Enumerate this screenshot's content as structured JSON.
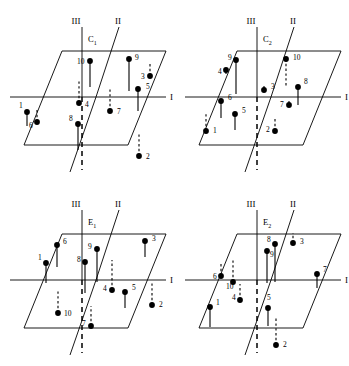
{
  "figure": {
    "title": "",
    "background_color": "#ffffff",
    "ink_color": "#000000",
    "width": 349,
    "height": 366,
    "panel_grid": {
      "rows": 2,
      "cols": 2
    }
  },
  "axis_labels": {
    "axis_i": "I",
    "axis_ii": "II",
    "axis_iii": "III"
  },
  "panels": [
    {
      "id": "panel-c1",
      "label": "C",
      "label_sub": "1",
      "position": {
        "x": 0,
        "y": 0
      },
      "sites": [
        {
          "num": "1",
          "dot": [
            27,
            112
          ],
          "label_pos": [
            19,
            108
          ],
          "stem": "down",
          "style": "solid",
          "stem_len": 14
        },
        {
          "num": "2",
          "dot": [
            139,
            156
          ],
          "label_pos": [
            146,
            159
          ],
          "stem": "up",
          "style": "dashed",
          "stem_len": 22
        },
        {
          "num": "3",
          "dot": [
            150,
            76
          ],
          "label_pos": [
            141,
            79
          ],
          "stem": "up",
          "style": "dashed",
          "stem_len": 13
        },
        {
          "num": "4",
          "dot": [
            79,
            103
          ],
          "label_pos": [
            85,
            107
          ],
          "stem": "up",
          "style": "dashed",
          "stem_len": 24
        },
        {
          "num": "5",
          "dot": [
            138,
            89
          ],
          "label_pos": [
            146,
            89
          ],
          "stem": "down",
          "style": "solid",
          "stem_len": 22
        },
        {
          "num": "6",
          "dot": [
            37,
            122
          ],
          "label_pos": [
            29,
            128
          ],
          "stem": "up",
          "style": "dashed",
          "stem_len": 14
        },
        {
          "num": "7",
          "dot": [
            110,
            111
          ],
          "label_pos": [
            117,
            114
          ],
          "stem": "up",
          "style": "dashed",
          "stem_len": 22
        },
        {
          "num": "8",
          "dot": [
            78,
            124
          ],
          "label_pos": [
            69,
            121
          ],
          "stem": "down",
          "style": "solid",
          "stem_len": 26
        },
        {
          "num": "9",
          "dot": [
            129,
            59
          ],
          "label_pos": [
            135,
            60
          ],
          "stem": "down",
          "style": "solid",
          "stem_len": 32
        },
        {
          "num": "10",
          "dot": [
            90,
            61
          ],
          "label_pos": [
            77,
            64
          ],
          "stem": "down",
          "style": "solid",
          "stem_len": 26
        }
      ]
    },
    {
      "id": "panel-c2",
      "label": "C",
      "label_sub": "2",
      "position": {
        "x": 175,
        "y": 0
      },
      "sites": [
        {
          "num": "1",
          "dot": [
            31,
            131
          ],
          "label_pos": [
            38,
            133
          ],
          "stem": "up",
          "style": "dashed",
          "stem_len": 18
        },
        {
          "num": "2",
          "dot": [
            100,
            131
          ],
          "label_pos": [
            91,
            132
          ],
          "stem": "up",
          "style": "dashed",
          "stem_len": 14
        },
        {
          "num": "3",
          "dot": [
            89,
            90
          ],
          "label_pos": [
            96,
            89
          ],
          "stem": "up",
          "style": "solid",
          "stem_len": 4
        },
        {
          "num": "4",
          "dot": [
            51,
            70
          ],
          "label_pos": [
            43,
            74
          ],
          "stem": "down",
          "style": "solid",
          "stem_len": 4
        },
        {
          "num": "5",
          "dot": [
            60,
            114
          ],
          "label_pos": [
            67,
            113
          ],
          "stem": "down",
          "style": "solid",
          "stem_len": 16
        },
        {
          "num": "6",
          "dot": [
            46,
            101
          ],
          "label_pos": [
            53,
            100
          ],
          "stem": "down",
          "style": "solid",
          "stem_len": 17
        },
        {
          "num": "7",
          "dot": [
            114,
            105
          ],
          "label_pos": [
            105,
            107
          ],
          "stem": "up",
          "style": "solid",
          "stem_len": 4
        },
        {
          "num": "8",
          "dot": [
            123,
            87
          ],
          "label_pos": [
            129,
            84
          ],
          "stem": "down",
          "style": "solid",
          "stem_len": 18
        },
        {
          "num": "9",
          "dot": [
            61,
            60
          ],
          "label_pos": [
            53,
            60
          ],
          "stem": "down",
          "style": "solid",
          "stem_len": 34
        },
        {
          "num": "10",
          "dot": [
            111,
            59
          ],
          "label_pos": [
            118,
            60
          ],
          "stem": "down",
          "style": "dashed",
          "stem_len": 28
        }
      ]
    },
    {
      "id": "panel-e1",
      "label": "E",
      "label_sub": "1",
      "position": {
        "x": 0,
        "y": 183
      },
      "sites": [
        {
          "num": "1",
          "dot": [
            46,
            80
          ],
          "label_pos": [
            38,
            77
          ],
          "stem": "down",
          "style": "solid",
          "stem_len": 20
        },
        {
          "num": "2",
          "dot": [
            152,
            122
          ],
          "label_pos": [
            159,
            124
          ],
          "stem": "up",
          "style": "dashed",
          "stem_len": 24
        },
        {
          "num": "3",
          "dot": [
            145,
            58
          ],
          "label_pos": [
            152,
            58
          ],
          "stem": "down",
          "style": "solid",
          "stem_len": 16
        },
        {
          "num": "4",
          "dot": [
            112,
            107
          ],
          "label_pos": [
            103,
            108
          ],
          "stem": "up",
          "style": "dashed",
          "stem_len": 30
        },
        {
          "num": "5",
          "dot": [
            125,
            109
          ],
          "label_pos": [
            132,
            107
          ],
          "stem": "down",
          "style": "solid",
          "stem_len": 16
        },
        {
          "num": "6",
          "dot": [
            57,
            62
          ],
          "label_pos": [
            63,
            61
          ],
          "stem": "down",
          "style": "solid",
          "stem_len": 22
        },
        {
          "num": "7",
          "dot": [
            91,
            143
          ],
          "label_pos": [
            82,
            143
          ],
          "stem": "up",
          "style": "dashed",
          "stem_len": 20
        },
        {
          "num": "8",
          "dot": [
            85,
            79
          ],
          "label_pos": [
            77,
            79
          ],
          "stem": "down",
          "style": "solid",
          "stem_len": 31
        },
        {
          "num": "9",
          "dot": [
            97,
            66
          ],
          "label_pos": [
            88,
            66
          ],
          "stem": "down",
          "style": "solid",
          "stem_len": 33
        },
        {
          "num": "10",
          "dot": [
            58,
            130
          ],
          "label_pos": [
            64,
            133
          ],
          "stem": "up",
          "style": "dashed",
          "stem_len": 22
        }
      ]
    },
    {
      "id": "panel-e2",
      "label": "E",
      "label_sub": "2",
      "position": {
        "x": 175,
        "y": 183
      },
      "sites": [
        {
          "num": "1",
          "dot": [
            35,
            124
          ],
          "label_pos": [
            41,
            122
          ],
          "stem": "down",
          "style": "solid",
          "stem_len": 20
        },
        {
          "num": "2",
          "dot": [
            101,
            162
          ],
          "label_pos": [
            108,
            164
          ],
          "stem": "up",
          "style": "dashed",
          "stem_len": 28
        },
        {
          "num": "3",
          "dot": [
            118,
            60
          ],
          "label_pos": [
            125,
            61
          ],
          "stem": "up",
          "style": "dashed",
          "stem_len": 10
        },
        {
          "num": "4",
          "dot": [
            65,
            117
          ],
          "label_pos": [
            57,
            117
          ],
          "stem": "up",
          "style": "dashed",
          "stem_len": 16
        },
        {
          "num": "5",
          "dot": [
            93,
            125
          ],
          "label_pos": [
            92,
            117
          ],
          "stem": "down",
          "style": "solid",
          "stem_len": 18
        },
        {
          "num": "6",
          "dot": [
            46,
            93
          ],
          "label_pos": [
            38,
            96
          ],
          "stem": "up",
          "style": "dashed",
          "stem_len": 13
        },
        {
          "num": "7",
          "dot": [
            142,
            91
          ],
          "label_pos": [
            148,
            89
          ],
          "stem": "down",
          "style": "solid",
          "stem_len": 14
        },
        {
          "num": "8",
          "dot": [
            100,
            61
          ],
          "label_pos": [
            92,
            59
          ],
          "stem": "down",
          "style": "solid",
          "stem_len": 38
        },
        {
          "num": "9",
          "dot": [
            92,
            68
          ],
          "label_pos": [
            95,
            74
          ],
          "stem": "down",
          "style": "solid",
          "stem_len": 32
        },
        {
          "num": "10",
          "dot": [
            58,
            99
          ],
          "label_pos": [
            51,
            106
          ],
          "stem": "up",
          "style": "dashed",
          "stem_len": 22
        }
      ]
    }
  ],
  "geometry": {
    "plane": {
      "top_left": [
        62,
        51
      ],
      "top_right": [
        166,
        51
      ],
      "bottom_right": [
        128,
        145
      ],
      "bottom_left": [
        24,
        145
      ]
    },
    "axis_i": {
      "x1": 10,
      "y1": 97,
      "x2": 166,
      "y2": 97
    },
    "axis_iii_solid": {
      "x1": 82,
      "y1": 27,
      "x2": 82,
      "y2": 97
    },
    "axis_iii_dashed": {
      "x1": 82,
      "y1": 97,
      "x2": 82,
      "y2": 170
    },
    "axis_ii_upper": {
      "x1": 119,
      "y1": 27,
      "x2": 96,
      "y2": 97
    },
    "axis_ii_lower": {
      "x1": 96,
      "y1": 97,
      "x2": 70,
      "y2": 172
    },
    "label_i_pos": [
      170,
      100
    ],
    "label_ii_pos": [
      118,
      24
    ],
    "label_iii_pos": [
      76,
      24
    ],
    "panel_label_pos": [
      88,
      42
    ]
  }
}
